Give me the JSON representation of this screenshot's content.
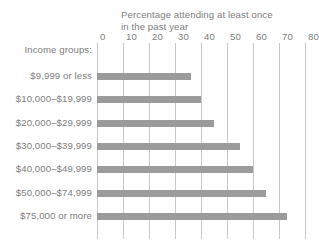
{
  "chart_data": {
    "type": "bar",
    "orientation": "horizontal",
    "title": "Percentage attending at least once\nin the past year",
    "xlabel": "Income groups:",
    "ylabel": "",
    "xlim": [
      0,
      80
    ],
    "xticks": [
      0,
      10,
      20,
      30,
      40,
      50,
      60,
      70,
      80
    ],
    "xtick_labels": [
      "0",
      "10",
      "20",
      "30",
      "40",
      "50",
      "60",
      "70",
      "80"
    ],
    "grid": "vertical",
    "legend": "none",
    "categories": [
      "$9,999 or less",
      "$10,000–$19,999",
      "$20,000–$29,999",
      "$30,000–$39,999",
      "$40,000–$49,999",
      "$50,000–$74,999",
      "$75,000 or more"
    ],
    "values": [
      36,
      40,
      45,
      55,
      60,
      65,
      73
    ],
    "colors": {
      "bar": "#9b9b9b",
      "gridline": "#c9c9c9",
      "text": "#7e7e7e",
      "background": "#ffffff"
    }
  }
}
